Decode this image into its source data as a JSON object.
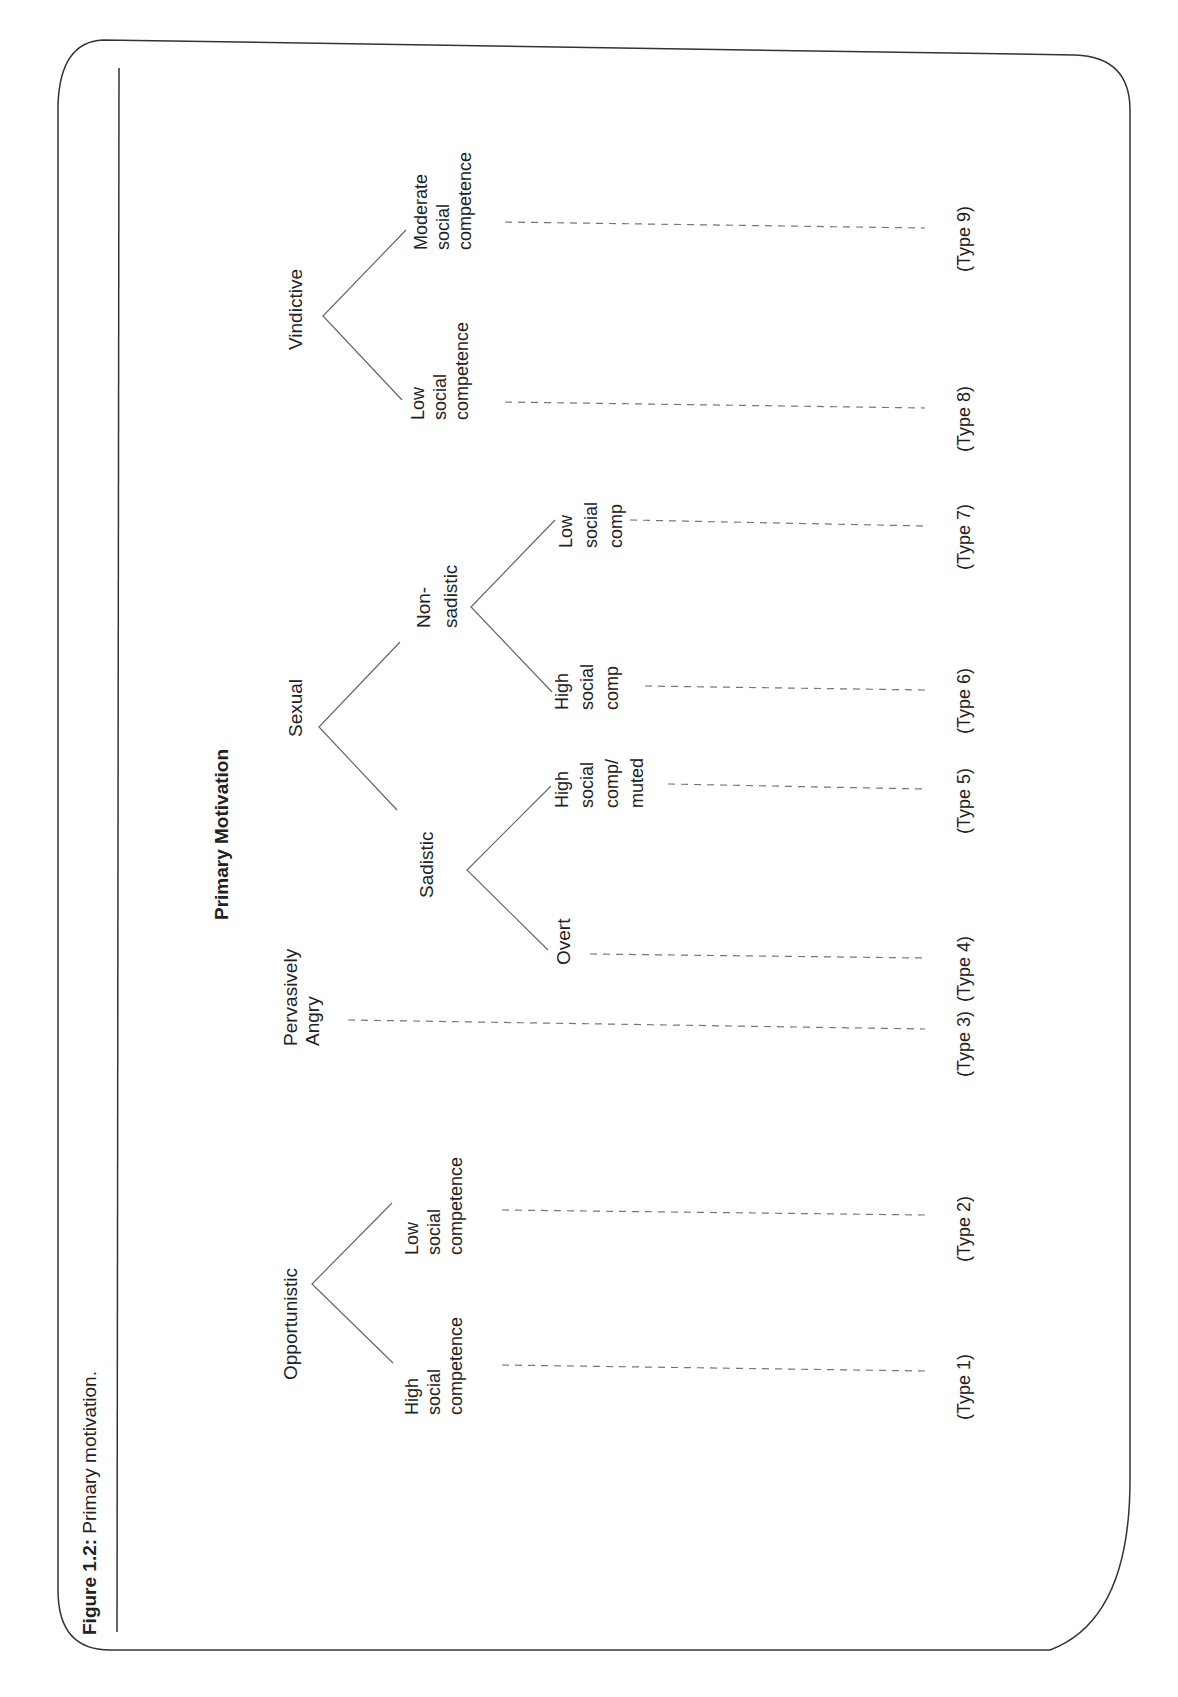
{
  "figure": {
    "label": "Figure 1.2:",
    "caption": "Primary motivation.",
    "title": "Primary Motivation"
  },
  "tree": {
    "opportunistic": {
      "label": "Opportunistic",
      "children": [
        {
          "lines": [
            "High",
            "social",
            "competence"
          ],
          "type": "(Type 1)"
        },
        {
          "lines": [
            "Low",
            "social",
            "competence"
          ],
          "type": "(Type 2)"
        }
      ]
    },
    "pervasively_angry": {
      "lines": [
        "Pervasively",
        "Angry"
      ],
      "type": "(Type 3)"
    },
    "sexual": {
      "label": "Sexual",
      "sadistic": {
        "label": "Sadistic",
        "children": [
          {
            "lines": [
              "Overt"
            ],
            "type": "(Type 4)"
          },
          {
            "lines": [
              "High",
              "social",
              "comp/",
              "muted"
            ],
            "type": "(Type 5)"
          }
        ]
      },
      "non_sadistic": {
        "lines": [
          "Non-",
          "sadistic"
        ],
        "children": [
          {
            "lines": [
              "High",
              "social",
              "comp"
            ],
            "type": "(Type 6)"
          },
          {
            "lines": [
              "Low",
              "social",
              "comp"
            ],
            "type": "(Type 7)"
          }
        ]
      }
    },
    "vindictive": {
      "label": "Vindictive",
      "children": [
        {
          "lines": [
            "Low",
            "social",
            "competence"
          ],
          "type": "(Type 8)"
        },
        {
          "lines": [
            "Moderate",
            "social",
            "competence"
          ],
          "type": "(Type 9)"
        }
      ]
    }
  }
}
